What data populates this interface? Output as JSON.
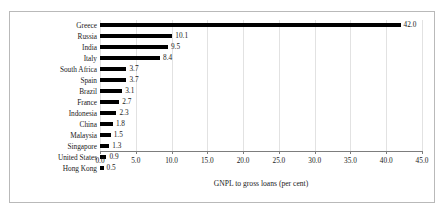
{
  "chart_data": {
    "type": "bar",
    "orientation": "horizontal",
    "title": "",
    "xlabel": "GNPL to gross loans (per cent)",
    "ylabel": "",
    "xlim": [
      0,
      45
    ],
    "xticks": [
      "0.0",
      "5.0",
      "10.0",
      "15.0",
      "20.0",
      "25.0",
      "30.0",
      "35.0",
      "40.0",
      "45.0"
    ],
    "grid": true,
    "legend": null,
    "bar_color": "#000000",
    "categories": [
      "Greece",
      "Russia",
      "India",
      "Italy",
      "South Africa",
      "Spain",
      "Brazil",
      "France",
      "Indonesia",
      "China",
      "Malaysia",
      "Singapore",
      "United States",
      "Hong Kong"
    ],
    "values": [
      42.0,
      10.1,
      9.5,
      8.4,
      3.7,
      3.7,
      3.1,
      2.7,
      2.3,
      1.8,
      1.5,
      1.3,
      0.9,
      0.5
    ],
    "value_labels": [
      "42.0",
      "10.1",
      "9.5",
      "8.4",
      "3.7",
      "3.7",
      "3.1",
      "2.7",
      "2.3",
      "1.8",
      "1.5",
      "1.3",
      "0.9",
      "0.5"
    ]
  }
}
